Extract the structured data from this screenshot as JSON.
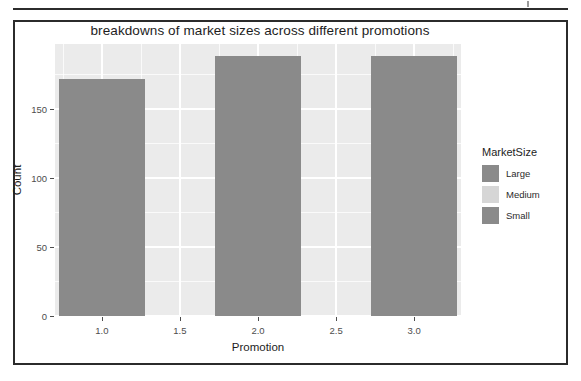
{
  "figure": {
    "title": "breakdowns of market sizes across different promotions"
  },
  "legend": {
    "title": "MarketSize",
    "items": [
      {
        "label": "Large",
        "color": "#8a8a8a"
      },
      {
        "label": "Medium",
        "color": "#d6d6d6"
      },
      {
        "label": "Small",
        "color": "#8a8a8a"
      }
    ]
  },
  "axes": {
    "y": {
      "label": "Count",
      "ticks": [
        "0",
        "50",
        "100",
        "150"
      ],
      "tick_values": [
        0,
        50,
        100,
        150
      ],
      "range": [
        0,
        197
      ]
    },
    "x": {
      "label": "Promotion",
      "ticks": [
        "1.0",
        "1.5",
        "2.0",
        "2.5",
        "3.0"
      ],
      "tick_values": [
        1.0,
        1.5,
        2.0,
        2.5,
        3.0
      ],
      "range": [
        0.7,
        3.3
      ]
    }
  },
  "panel": {
    "background": "#ebebeb",
    "gridline_color": "#ffffff"
  },
  "chart_data": {
    "type": "bar",
    "stacked": true,
    "title": "breakdowns of market sizes across different promotions",
    "xlabel": "Promotion",
    "ylabel": "Count",
    "categories": [
      "1.0",
      "2.0",
      "3.0"
    ],
    "x": [
      1,
      2,
      3
    ],
    "xlim": [
      0.7,
      3.3
    ],
    "ylim": [
      0,
      197
    ],
    "grid": true,
    "legend_position": "right",
    "legend_title": "MarketSize",
    "series": [
      {
        "name": "Large",
        "color": "#8a8a8a",
        "values": [
          152,
          188,
          168
        ]
      },
      {
        "name": "Medium",
        "color": "#d6d6d6",
        "values": [
          0,
          0,
          0
        ]
      },
      {
        "name": "Small",
        "color": "#8a8a8a",
        "values": [
          20,
          0,
          20
        ]
      }
    ],
    "totals": [
      172,
      188,
      188
    ]
  }
}
